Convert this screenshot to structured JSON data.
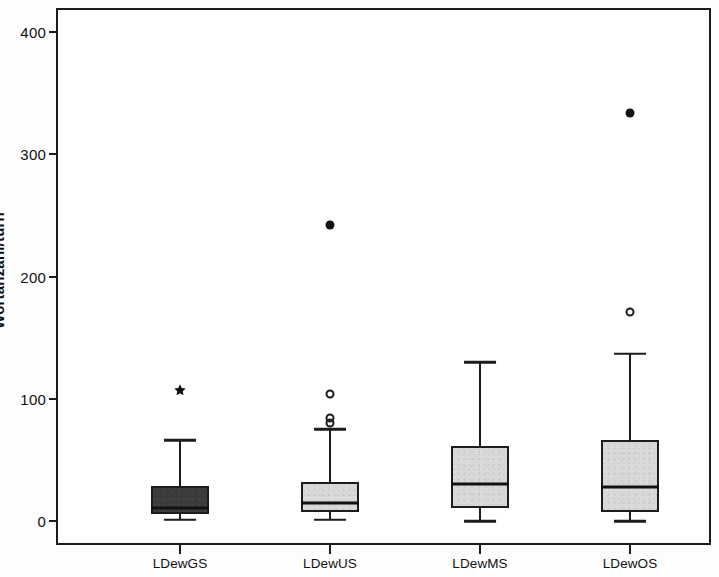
{
  "chart_data": {
    "type": "box",
    "title": "",
    "subtitle": "",
    "xlabel": "",
    "ylabel": "Wortanzahl/turn",
    "categories": [
      "LDewGS",
      "LDewUS",
      "LDewMS",
      "LDewOS"
    ],
    "ylim": [
      -8,
      425
    ],
    "y_ticks": [
      0,
      100,
      200,
      300,
      400
    ],
    "y_tick_labels": [
      "0",
      "100",
      "200",
      "300",
      "400"
    ],
    "grid": false,
    "legend": "none",
    "box_fill_colors": [
      "#3b3b3b",
      "#d9d9d9",
      "#d9d9d9",
      "#d9d9d9"
    ],
    "line_color": "#1c1c1c",
    "boxes": [
      {
        "category": "LDewGS",
        "whisker_low": 1,
        "q1": 6,
        "median": 11,
        "q3": 29,
        "whisker_high": 66,
        "fill": "dark",
        "outliers": [],
        "extremes": [
          107
        ]
      },
      {
        "category": "LDewUS",
        "whisker_low": 1,
        "q1": 7,
        "median": 15,
        "q3": 32,
        "whisker_high": 75,
        "fill": "light",
        "outliers": [
          104,
          84,
          80
        ],
        "extremes": [
          242
        ]
      },
      {
        "category": "LDewMS",
        "whisker_low": 0,
        "q1": 11,
        "median": 30,
        "q3": 61,
        "whisker_high": 130,
        "fill": "light",
        "outliers": [],
        "extremes": []
      },
      {
        "category": "LDewOS",
        "whisker_low": 0,
        "q1": 7,
        "median": 28,
        "q3": 66,
        "whisker_high": 137,
        "fill": "light",
        "outliers": [
          171
        ],
        "extremes": [
          334
        ]
      }
    ]
  }
}
